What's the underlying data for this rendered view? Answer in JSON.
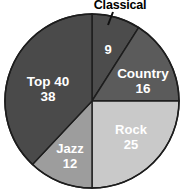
{
  "chart_data": {
    "type": "pie",
    "title": "",
    "categories": [
      "Classical",
      "Country",
      "Rock",
      "Jazz",
      "Top 40"
    ],
    "values": [
      9,
      16,
      25,
      12,
      38
    ],
    "total": 100,
    "start_angle_deg": 0,
    "direction": "clockwise",
    "legend": "none",
    "grid": false,
    "slice_colors": [
      "#4c4c4c",
      "#5b5b5b",
      "#c9c9c9",
      "#9d9d9d",
      "#4a4a4a"
    ],
    "label_colors": [
      "#ffffff",
      "#ffffff",
      "#ffffff",
      "#ffffff",
      "#ffffff"
    ],
    "slices": [
      {
        "name": "Classical",
        "value": 9,
        "value_text": "9",
        "name_text": "Classical",
        "color": "#4c4c4c",
        "label_color": "#ffffff",
        "label_placement": "callout",
        "value_x": 108,
        "value_y": 51,
        "value_font_size": 13,
        "callout_x": 120,
        "callout_y": 6,
        "leader_x1": 113,
        "leader_y1": 12,
        "leader_x2": 108,
        "leader_y2": 25
      },
      {
        "name": "Country",
        "value": 16,
        "value_text": "16",
        "name_text": "Country",
        "color": "#5b5b5b",
        "label_color": "#ffffff",
        "label_placement": "inside",
        "name_x": 143,
        "name_y": 74,
        "value_x": 143,
        "value_y": 89,
        "name_font_size": 13.5,
        "value_font_size": 13.5
      },
      {
        "name": "Rock",
        "value": 25,
        "value_text": "25",
        "name_text": "Rock",
        "color": "#c9c9c9",
        "label_color": "#ffffff",
        "label_placement": "inside",
        "name_x": 131,
        "name_y": 131,
        "value_x": 131,
        "value_y": 146,
        "name_font_size": 13,
        "value_font_size": 13
      },
      {
        "name": "Jazz",
        "value": 12,
        "value_text": "12",
        "name_text": "Jazz",
        "color": "#9d9d9d",
        "label_color": "#ffffff",
        "label_placement": "inside",
        "name_x": 70,
        "name_y": 150,
        "value_x": 70,
        "value_y": 165,
        "name_font_size": 13,
        "value_font_size": 13
      },
      {
        "name": "Top 40",
        "value": 38,
        "value_text": "38",
        "name_text": "Top 40",
        "color": "#4a4a4a",
        "label_color": "#ffffff",
        "label_placement": "inside",
        "name_x": 48,
        "name_y": 82,
        "value_x": 48,
        "value_y": 97,
        "name_font_size": 13.5,
        "value_font_size": 13.5
      }
    ],
    "geometry": {
      "center_x": 92,
      "center_y": 101,
      "radius": 87
    }
  }
}
